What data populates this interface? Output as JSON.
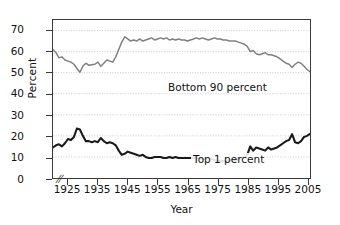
{
  "chart_data": {
    "type": "line",
    "title": "",
    "xlabel": "Year",
    "ylabel": "Percent",
    "xlim": [
      1920,
      2006
    ],
    "ylim": [
      0,
      75
    ],
    "yticks": [
      0,
      10,
      20,
      30,
      40,
      50,
      60,
      70
    ],
    "xticks": [
      1925,
      1935,
      1945,
      1955,
      1965,
      1975,
      1985,
      1995,
      2005
    ],
    "grid": "horizontal-dotted",
    "legend": "in-plot-annotations",
    "axis_break": "//",
    "series": [
      {
        "name": "Bottom 90 percent",
        "color": "#808080",
        "label_x": 1948,
        "label_y": 57,
        "x": [
          1920,
          1921,
          1922,
          1923,
          1924,
          1925,
          1926,
          1927,
          1928,
          1929,
          1930,
          1931,
          1932,
          1933,
          1934,
          1935,
          1936,
          1937,
          1938,
          1939,
          1940,
          1941,
          1942,
          1943,
          1944,
          1945,
          1946,
          1947,
          1948,
          1949,
          1950,
          1951,
          1952,
          1953,
          1954,
          1955,
          1956,
          1957,
          1958,
          1959,
          1960,
          1961,
          1962,
          1963,
          1964,
          1965,
          1966,
          1967,
          1968,
          1969,
          1970,
          1971,
          1972,
          1973,
          1974,
          1975,
          1976,
          1977,
          1978,
          1979,
          1980,
          1981,
          1982,
          1983,
          1984,
          1985,
          1986,
          1987,
          1988,
          1989,
          1990,
          1991,
          1992,
          1993,
          1994,
          1995,
          1996,
          1997,
          1998,
          1999,
          2000,
          2001,
          2002,
          2003,
          2004,
          2005,
          2006
        ],
        "y": [
          61.0,
          59.5,
          57.0,
          57.5,
          56.0,
          55.5,
          55.0,
          54.0,
          52.0,
          50.2,
          53.0,
          54.5,
          53.5,
          53.8,
          54.0,
          55.0,
          53.0,
          54.5,
          56.0,
          55.5,
          55.0,
          57.5,
          61.0,
          64.5,
          67.0,
          66.0,
          65.0,
          65.5,
          65.0,
          66.0,
          65.0,
          65.5,
          66.0,
          66.5,
          65.5,
          66.0,
          66.5,
          66.0,
          66.5,
          65.5,
          66.0,
          65.5,
          66.0,
          65.5,
          65.5,
          65.0,
          65.5,
          66.0,
          66.5,
          66.0,
          66.5,
          66.0,
          65.5,
          66.0,
          66.5,
          66.0,
          66.0,
          65.5,
          65.5,
          65.0,
          65.0,
          65.0,
          64.5,
          64.0,
          63.5,
          62.5,
          60.0,
          60.5,
          59.0,
          58.5,
          59.0,
          59.5,
          58.5,
          58.5,
          58.0,
          57.5,
          56.5,
          55.5,
          54.5,
          54.0,
          52.5,
          54.0,
          55.0,
          54.5,
          53.0,
          51.5,
          50.5
        ]
      },
      {
        "name": "Top 1 percent",
        "color": "#1a1a1a",
        "label_x": 1957,
        "label_y": 14,
        "x": [
          1920,
          1921,
          1922,
          1923,
          1924,
          1925,
          1926,
          1927,
          1928,
          1929,
          1930,
          1931,
          1932,
          1933,
          1934,
          1935,
          1936,
          1937,
          1938,
          1939,
          1940,
          1941,
          1942,
          1943,
          1944,
          1945,
          1946,
          1947,
          1948,
          1949,
          1950,
          1951,
          1952,
          1953,
          1954,
          1955,
          1956,
          1957,
          1958,
          1959,
          1960,
          1961,
          1962,
          1963,
          1964,
          1965,
          1966,
          1967,
          1968,
          1969,
          1970,
          1971,
          1972,
          1973,
          1974,
          1975,
          1976,
          1977,
          1978,
          1979,
          1980,
          1981,
          1982,
          1983,
          1984,
          1985,
          1986,
          1987,
          1988,
          1989,
          1990,
          1991,
          1992,
          1993,
          1994,
          1995,
          1996,
          1997,
          1998,
          1999,
          2000,
          2001,
          2002,
          2003,
          2004,
          2005,
          2006
        ],
        "y": [
          14.5,
          15.5,
          16.0,
          15.0,
          16.5,
          18.5,
          18.0,
          19.5,
          23.5,
          23.0,
          20.0,
          17.5,
          17.5,
          17.0,
          17.5,
          17.0,
          19.0,
          17.5,
          16.5,
          17.0,
          16.5,
          15.5,
          13.0,
          11.0,
          11.5,
          12.5,
          12.0,
          11.5,
          11.0,
          10.5,
          11.0,
          10.0,
          9.5,
          9.5,
          10.0,
          10.0,
          10.0,
          9.5,
          9.5,
          10.0,
          9.5,
          10.0,
          9.5,
          9.5,
          9.5,
          9.5,
          9.5,
          9.5,
          10.0,
          9.5,
          9.0,
          9.0,
          9.5,
          9.0,
          8.5,
          8.0,
          8.0,
          8.0,
          8.0,
          8.5,
          8.5,
          8.5,
          9.0,
          9.5,
          10.0,
          11.0,
          15.0,
          13.0,
          14.5,
          14.0,
          13.5,
          13.0,
          14.5,
          13.5,
          14.0,
          14.5,
          15.5,
          16.5,
          17.5,
          18.0,
          20.8,
          17.0,
          16.5,
          17.5,
          19.5,
          20.0,
          21.0
        ]
      }
    ]
  },
  "axes": {
    "y_title": "Percent",
    "x_title": "Year",
    "y_tick_labels": [
      "0",
      "10",
      "20",
      "30",
      "40",
      "50",
      "60",
      "70"
    ],
    "x_tick_labels": [
      "1925",
      "1935",
      "1945",
      "1955",
      "1965",
      "1975",
      "1985",
      "1995",
      "2005"
    ],
    "break_glyph": "//"
  },
  "style": {
    "frame_color": "#3a3a3a",
    "grid_color": "#b9b9c6",
    "background": "#ffffff"
  }
}
